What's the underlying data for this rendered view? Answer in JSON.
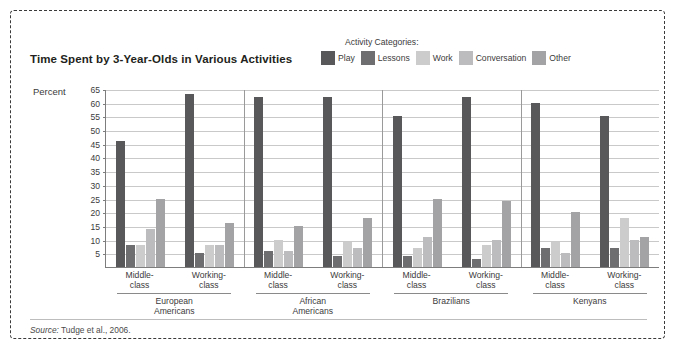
{
  "figure": {
    "title": "Time Spent by 3-Year-Olds in Various Activities",
    "source_prefix": "Source:",
    "source_text": " Tudge et al., 2006."
  },
  "legend": {
    "title": "Activity Categories:",
    "items": [
      {
        "label": "Play",
        "color": "#58585b"
      },
      {
        "label": "Lessons",
        "color": "#6e6e71"
      },
      {
        "label": "Work",
        "color": "#cccccd"
      },
      {
        "label": "Conversation",
        "color": "#bcbcbe"
      },
      {
        "label": "Other",
        "color": "#a3a3a5"
      }
    ]
  },
  "axes": {
    "y_label": "Percent",
    "y_ticks": [
      65,
      60,
      55,
      50,
      45,
      40,
      35,
      30,
      25,
      20,
      15,
      10,
      5
    ],
    "y_min": 0,
    "y_max": 65
  },
  "chart_data": {
    "type": "bar",
    "title": "Time Spent by 3-Year-Olds in Various Activities",
    "xlabel": "",
    "ylabel": "Percent",
    "ylim": [
      0,
      65
    ],
    "grid": true,
    "legend_position": "top-right",
    "series": [
      {
        "name": "Play",
        "color": "#58585b"
      },
      {
        "name": "Lessons",
        "color": "#6e6e71"
      },
      {
        "name": "Work",
        "color": "#cccccd"
      },
      {
        "name": "Conversation",
        "color": "#bcbcbe"
      },
      {
        "name": "Other",
        "color": "#a3a3a5"
      }
    ],
    "groups": [
      {
        "group": "European Americans",
        "group_line1": "European",
        "group_line2": "Americans",
        "subgroups": [
          {
            "label_line1": "Middle-",
            "label_line2": "class",
            "values": [
              46,
              8,
              8,
              14,
              25
            ]
          },
          {
            "label_line1": "Working-",
            "label_line2": "class",
            "values": [
              63,
              5,
              8,
              8,
              16
            ]
          }
        ]
      },
      {
        "group": "African Americans",
        "group_line1": "African",
        "group_line2": "Americans",
        "subgroups": [
          {
            "label_line1": "Middle-",
            "label_line2": "class",
            "values": [
              62,
              6,
              10,
              6,
              15
            ]
          },
          {
            "label_line1": "Working-",
            "label_line2": "class",
            "values": [
              62,
              4,
              9,
              7,
              18
            ]
          }
        ]
      },
      {
        "group": "Brazilians",
        "group_line1": "Brazilians",
        "group_line2": "",
        "subgroups": [
          {
            "label_line1": "Middle-",
            "label_line2": "class",
            "values": [
              55,
              4,
              7,
              11,
              25
            ]
          },
          {
            "label_line1": "Working-",
            "label_line2": "class",
            "values": [
              62,
              3,
              8,
              10,
              24
            ]
          }
        ]
      },
      {
        "group": "Kenyans",
        "group_line1": "Kenyans",
        "group_line2": "",
        "subgroups": [
          {
            "label_line1": "Middle-",
            "label_line2": "class",
            "values": [
              60,
              7,
              9,
              5,
              20
            ]
          },
          {
            "label_line1": "Working-",
            "label_line2": "class",
            "values": [
              55,
              7,
              18,
              10,
              11
            ]
          }
        ]
      }
    ]
  }
}
